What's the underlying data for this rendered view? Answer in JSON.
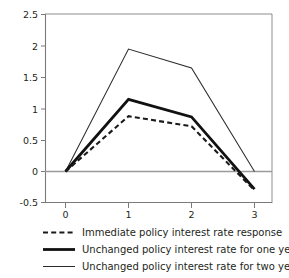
{
  "chart_data": {
    "type": "line",
    "title": "",
    "xlabel": "",
    "ylabel": "",
    "x": [
      0,
      1,
      2,
      3
    ],
    "xlim": [
      -0.35,
      3.3
    ],
    "ylim": [
      -0.5,
      2.5
    ],
    "xticks": [
      "0",
      "1",
      "2",
      "3"
    ],
    "yticks": [
      "-0.5",
      "0",
      "0.5",
      "1",
      "1.5",
      "2",
      "2.5"
    ],
    "ytick_values": [
      -0.5,
      0,
      0.5,
      1,
      1.5,
      2,
      2.5
    ],
    "grid": false,
    "zero_line": true,
    "legend_position": "below",
    "series": [
      {
        "name": "Immediate policy interest rate response",
        "style": "dashed",
        "values": [
          0,
          0.88,
          0.72,
          -0.3
        ]
      },
      {
        "name": "Unchanged policy interest rate for one year",
        "style": "thick-solid",
        "values": [
          0,
          1.15,
          0.87,
          -0.28
        ]
      },
      {
        "name": "Unchanged policy interest rate for two years",
        "style": "thin-solid",
        "values": [
          0,
          1.95,
          1.65,
          0
        ]
      }
    ]
  },
  "legend": {
    "items": [
      {
        "label": "Immediate policy interest rate response",
        "style": "dashed"
      },
      {
        "label": "Unchanged policy interest rate for one year",
        "style": "thick-solid"
      },
      {
        "label": "Unchanged policy interest rate for two years",
        "style": "thin-solid"
      }
    ]
  },
  "colors": {
    "line": "#1a1a1a",
    "axis": "#7a7a7a",
    "frame": "#8d8d8d",
    "background": "#ffffff"
  }
}
